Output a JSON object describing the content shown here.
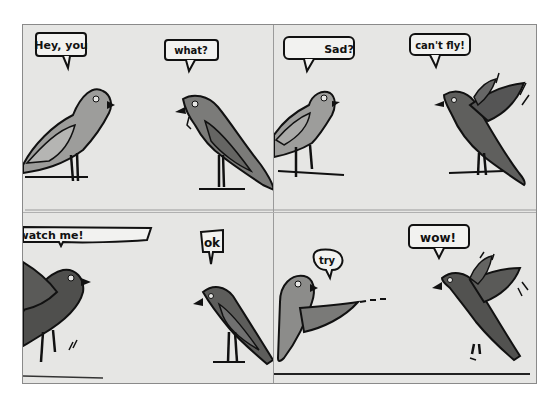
{
  "comic": {
    "panels": [
      {
        "index": 1,
        "bubbles": [
          {
            "speaker": "left-bird",
            "text": "Hey, you"
          },
          {
            "speaker": "right-bird",
            "text": "what?"
          }
        ]
      },
      {
        "index": 2,
        "bubbles": [
          {
            "speaker": "left-bird",
            "text": "Sad?"
          },
          {
            "speaker": "right-bird",
            "text": "can't fly!"
          }
        ]
      },
      {
        "index": 3,
        "bubbles": [
          {
            "speaker": "left-bird",
            "text": "watch me!"
          },
          {
            "speaker": "right-bird",
            "text": "ok"
          }
        ]
      },
      {
        "index": 4,
        "bubbles": [
          {
            "speaker": "left-bird",
            "text": "try"
          },
          {
            "speaker": "right-bird",
            "text": "wow!"
          }
        ]
      }
    ]
  },
  "colors": {
    "paper": "#e6e6e4",
    "ink": "#111111",
    "light_bird": "#9a9a98",
    "dark_bird": "#555555"
  }
}
